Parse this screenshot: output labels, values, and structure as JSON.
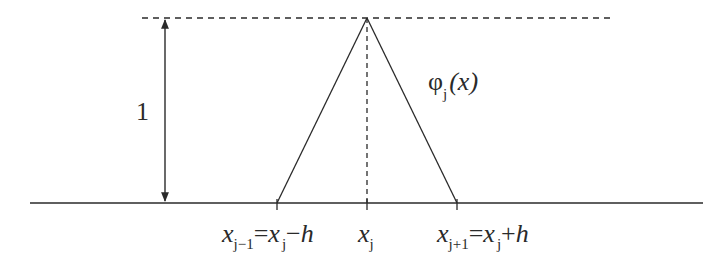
{
  "diagram": {
    "type": "hat-basis-function",
    "height_label": "1",
    "function_label": {
      "symbol": "φ",
      "subscript": "j",
      "argument": "(x)"
    },
    "nodes": [
      {
        "id": "left",
        "var": "x",
        "sub": "j−1",
        "eq": "=",
        "rhs_var": "x",
        "rhs_sub": "j",
        "rhs_op": "−",
        "rhs_step": "h"
      },
      {
        "id": "center",
        "var": "x",
        "sub": "j"
      },
      {
        "id": "right",
        "var": "x",
        "sub": "j+1",
        "eq": "=",
        "rhs_var": "x",
        "rhs_sub": "j",
        "rhs_op": "+",
        "rhs_step": "h"
      }
    ],
    "colors": {
      "line": "#2a2a2a",
      "background": "#ffffff"
    }
  }
}
